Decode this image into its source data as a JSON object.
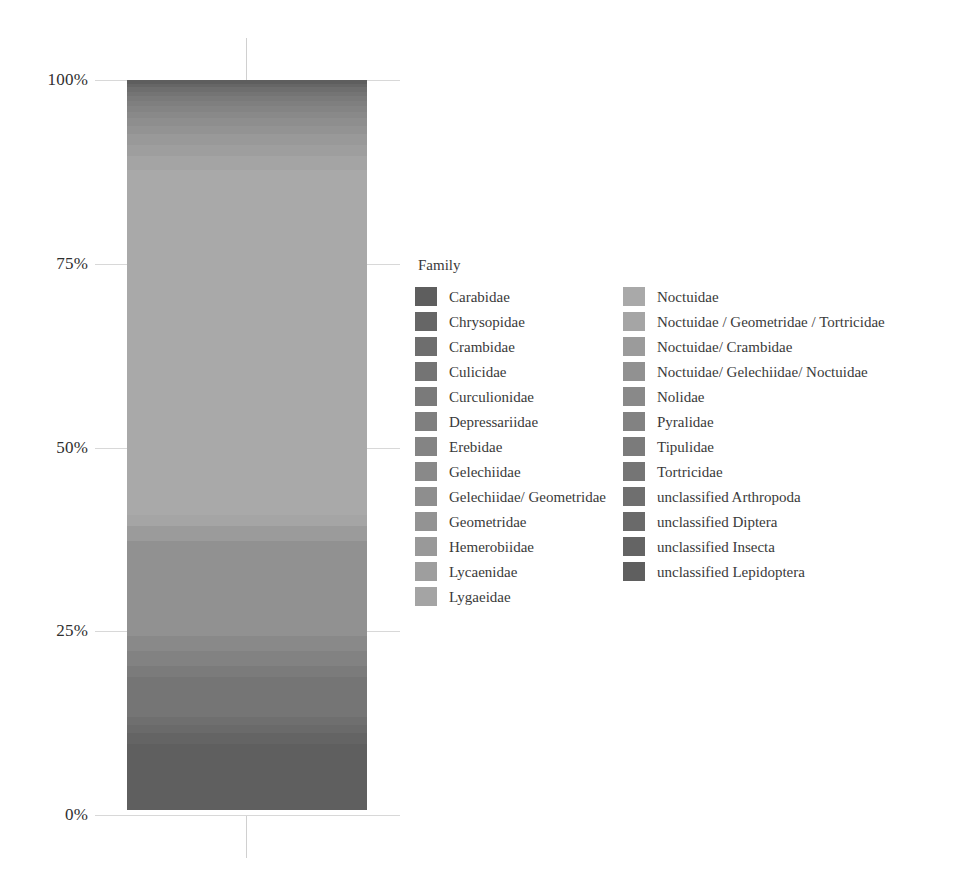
{
  "chart_data": {
    "type": "bar",
    "title": "",
    "xlabel": "",
    "ylabel": "",
    "ylim": [
      0,
      100
    ],
    "grid": true,
    "stacked": true,
    "normalized_percent": true,
    "legend_title": "Family",
    "legend_position": "right",
    "axis": {
      "tick_labels": [
        "100%",
        "75%",
        "50%",
        "25%",
        "0%"
      ],
      "tick_values": [
        100,
        75,
        50,
        25,
        0
      ]
    },
    "categories": [
      "sample"
    ],
    "series": [
      {
        "name": "Carabidae",
        "values": [
          0.5
        ],
        "color": "#5e5e5e"
      },
      {
        "name": "Chrysopidae",
        "values": [
          0.5
        ],
        "color": "#666666"
      },
      {
        "name": "Crambidae",
        "values": [
          0.6
        ],
        "color": "#6e6e6e"
      },
      {
        "name": "Culicidae",
        "values": [
          0.6
        ],
        "color": "#747474"
      },
      {
        "name": "Curculionidae",
        "values": [
          0.6
        ],
        "color": "#7a7a7a"
      },
      {
        "name": "Depressariidae",
        "values": [
          0.7
        ],
        "color": "#7f7f7f"
      },
      {
        "name": "Erebidae",
        "values": [
          0.8
        ],
        "color": "#848484"
      },
      {
        "name": "Gelechiidae",
        "values": [
          0.9
        ],
        "color": "#898989"
      },
      {
        "name": "Gelechiidae/ Geometridae",
        "values": [
          1.0
        ],
        "color": "#8e8e8e"
      },
      {
        "name": "Geometridae",
        "values": [
          1.2
        ],
        "color": "#939393"
      },
      {
        "name": "Hemerobiidae",
        "values": [
          1.4
        ],
        "color": "#999999"
      },
      {
        "name": "Lycaenidae",
        "values": [
          1.6
        ],
        "color": "#9e9e9e"
      },
      {
        "name": "Lygaeidae",
        "values": [
          1.8
        ],
        "color": "#a4a4a4"
      },
      {
        "name": "Noctuidae",
        "values": [
          47.0
        ],
        "color": "#a9a9a9"
      },
      {
        "name": "Noctuidae / Geometridae / Tortricidae",
        "values": [
          1.5
        ],
        "color": "#a5a5a5"
      },
      {
        "name": "Noctuidae/ Crambidae",
        "values": [
          2.0
        ],
        "color": "#9b9b9b"
      },
      {
        "name": "Noctuidae/ Gelechiidae/ Noctuidae",
        "values": [
          13.0
        ],
        "color": "#919191"
      },
      {
        "name": "Nolidae",
        "values": [
          2.0
        ],
        "color": "#898989"
      },
      {
        "name": "Pyralidae",
        "values": [
          2.0
        ],
        "color": "#828282"
      },
      {
        "name": "Tipulidae",
        "values": [
          1.5
        ],
        "color": "#7b7b7b"
      },
      {
        "name": "Tortricidae",
        "values": [
          5.5
        ],
        "color": "#757575"
      },
      {
        "name": "unclassified Arthropoda",
        "values": [
          1.0
        ],
        "color": "#6f6f6f"
      },
      {
        "name": "unclassified Diptera",
        "values": [
          1.2
        ],
        "color": "#6a6a6a"
      },
      {
        "name": "unclassified Insecta",
        "values": [
          1.4
        ],
        "color": "#646464"
      },
      {
        "name": "unclassified Lepidoptera",
        "values": [
          9.0
        ],
        "color": "#5f5f5f"
      }
    ]
  },
  "legend": {
    "title": "Family",
    "column1": [
      {
        "label": "Carabidae",
        "color": "#5e5e5e"
      },
      {
        "label": "Chrysopidae",
        "color": "#666666"
      },
      {
        "label": "Crambidae",
        "color": "#6e6e6e"
      },
      {
        "label": "Culicidae",
        "color": "#747474"
      },
      {
        "label": "Curculionidae",
        "color": "#7a7a7a"
      },
      {
        "label": "Depressariidae",
        "color": "#7f7f7f"
      },
      {
        "label": "Erebidae",
        "color": "#848484"
      },
      {
        "label": "Gelechiidae",
        "color": "#898989"
      },
      {
        "label": "Gelechiidae/ Geometridae",
        "color": "#8e8e8e"
      },
      {
        "label": "Geometridae",
        "color": "#939393"
      },
      {
        "label": "Hemerobiidae",
        "color": "#999999"
      },
      {
        "label": "Lycaenidae",
        "color": "#9e9e9e"
      },
      {
        "label": "Lygaeidae",
        "color": "#a4a4a4"
      }
    ],
    "column2": [
      {
        "label": "Noctuidae",
        "color": "#a9a9a9"
      },
      {
        "label": "Noctuidae / Geometridae / Tortricidae",
        "color": "#a5a5a5"
      },
      {
        "label": "Noctuidae/ Crambidae",
        "color": "#9b9b9b"
      },
      {
        "label": "Noctuidae/ Gelechiidae/ Noctuidae",
        "color": "#919191"
      },
      {
        "label": "Nolidae",
        "color": "#898989"
      },
      {
        "label": "Pyralidae",
        "color": "#828282"
      },
      {
        "label": "Tipulidae",
        "color": "#7b7b7b"
      },
      {
        "label": "Tortricidae",
        "color": "#757575"
      },
      {
        "label": "unclassified Arthropoda",
        "color": "#6f6f6f"
      },
      {
        "label": "unclassified Diptera",
        "color": "#6a6a6a"
      },
      {
        "label": "unclassified Insecta",
        "color": "#646464"
      },
      {
        "label": "unclassified Lepidoptera",
        "color": "#5f5f5f"
      }
    ]
  }
}
